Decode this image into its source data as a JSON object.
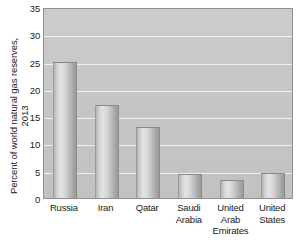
{
  "chart_data": {
    "type": "bar",
    "title": "",
    "subtitle": "",
    "xlabel": "",
    "ylabel": "Percent of world natural gas reserves, 2013",
    "ylabel_lines": [
      "Percent of world natural gas reserves,",
      "2013"
    ],
    "categories": [
      "Russia",
      "Iran",
      "Qatar",
      "Saudi Arabia",
      "United Arab Emirates",
      "United States"
    ],
    "category_lines": [
      [
        "Russia"
      ],
      [
        "Iran"
      ],
      [
        "Qatar"
      ],
      [
        "Saudi",
        "Arabia"
      ],
      [
        "United",
        "Arab",
        "Emirates"
      ],
      [
        "United",
        "States"
      ]
    ],
    "values": [
      25.0,
      17.0,
      13.0,
      4.4,
      3.3,
      4.5
    ],
    "ylim": [
      0,
      35
    ],
    "yticks": [
      0,
      5,
      10,
      15,
      20,
      25,
      30,
      35
    ],
    "ytick_labels": [
      "0",
      "5",
      "10",
      "15",
      "20",
      "25",
      "30",
      "35"
    ],
    "grid": true,
    "grid_axis": "y",
    "legend": false,
    "legend_position": "none",
    "colors": {
      "plot_background": "#c7c7c7",
      "gridline": "#f2f2f2",
      "bar_light": "#e3e3e3",
      "bar_mid": "#c0c0c0",
      "bar_dark": "#9b9b9b",
      "axis_border": "#8f8f8f",
      "text": "#1a1a1a",
      "figure_background": "#ffffff"
    }
  }
}
